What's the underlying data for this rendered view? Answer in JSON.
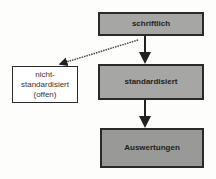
{
  "diagram": {
    "type": "flowchart",
    "nodes": [
      {
        "id": "schriftlich",
        "label": "schriftlich",
        "style": "gray"
      },
      {
        "id": "nicht_standardisiert",
        "label": "nicht-\nstandardisiert\n(offen)",
        "style": "white"
      },
      {
        "id": "standardisiert",
        "label": "standardisiert",
        "style": "gray"
      },
      {
        "id": "auswertungen",
        "label": "Auswertungen",
        "style": "gray"
      }
    ],
    "edges": [
      {
        "from": "schriftlich",
        "to": "standardisiert",
        "style": "solid"
      },
      {
        "from": "schriftlich",
        "to": "nicht_standardisiert",
        "style": "dotted"
      },
      {
        "from": "standardisiert",
        "to": "auswertungen",
        "style": "solid"
      }
    ],
    "colors": {
      "box_fill": "#a6a6a4",
      "box_border": "#2a2a2a",
      "background": "#fdfdfb"
    }
  }
}
